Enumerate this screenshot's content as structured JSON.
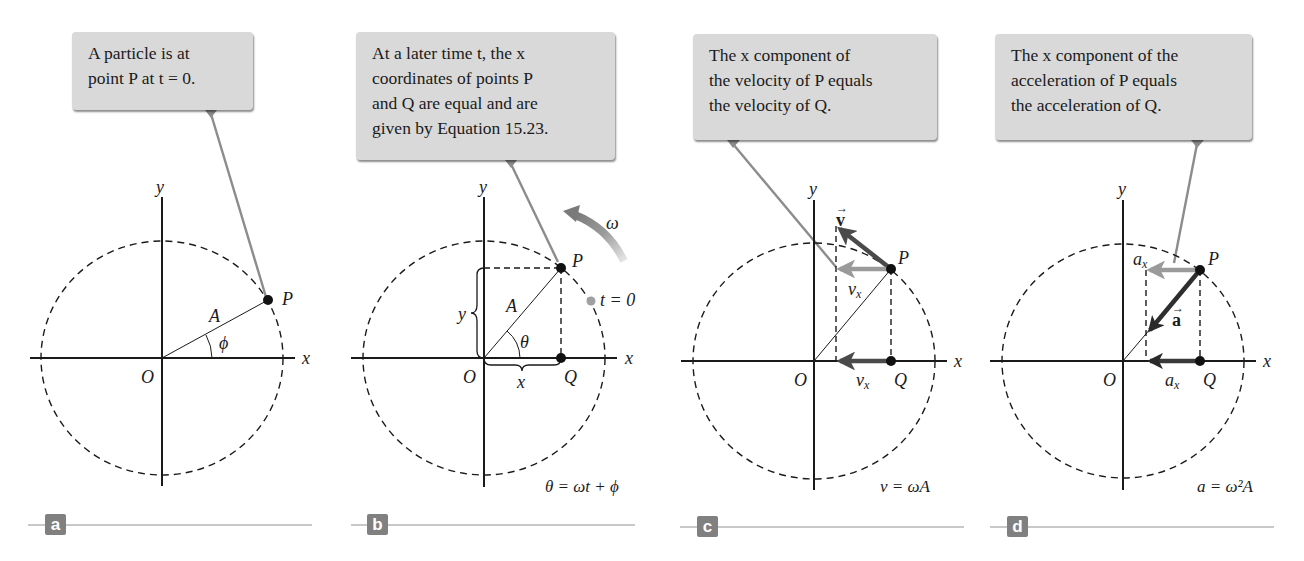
{
  "figure": {
    "panels": [
      {
        "id": "a",
        "label": "a",
        "callout": {
          "lines": [
            "A particle is at",
            "point P at t = 0."
          ]
        },
        "axis_labels": {
          "x": "x",
          "y": "y",
          "origin": "O"
        },
        "point_labels": {
          "P": "P",
          "radius": "A",
          "angle": "ϕ"
        }
      },
      {
        "id": "b",
        "label": "b",
        "callout": {
          "lines": [
            "At a later time t, the x",
            "coordinates of points P",
            "and Q are equal and are",
            "given by Equation 15.23."
          ]
        },
        "axis_labels": {
          "x": "x",
          "y": "y",
          "origin": "O"
        },
        "point_labels": {
          "P": "P",
          "Q": "Q",
          "radius": "A",
          "angle": "θ",
          "x_brace": "x",
          "y_brace": "y",
          "initial": "t = 0",
          "omega": "ω"
        },
        "equation": "θ = ωt + ϕ"
      },
      {
        "id": "c",
        "label": "c",
        "callout": {
          "lines": [
            "The x component of",
            "the velocity of P equals",
            "the velocity of Q."
          ]
        },
        "axis_labels": {
          "x": "x",
          "y": "y",
          "origin": "O"
        },
        "point_labels": {
          "P": "P",
          "Q": "Q",
          "vector": "v",
          "component_top": "vx",
          "component_bottom": "vx"
        },
        "equation": "v = ωA"
      },
      {
        "id": "d",
        "label": "d",
        "callout": {
          "lines": [
            "The x component of the",
            "acceleration of P equals",
            "the acceleration of Q."
          ]
        },
        "axis_labels": {
          "x": "x",
          "y": "y",
          "origin": "O"
        },
        "point_labels": {
          "P": "P",
          "Q": "Q",
          "vector": "a",
          "component_top": "ax",
          "component_bottom": "ax"
        },
        "equation": "a = ω²A"
      }
    ],
    "colors": {
      "callout_fill": "#d9d9d9",
      "connector": "#8c8c8c",
      "label_box": "#808080",
      "rule": "#c8c8c8",
      "vector_dark": "#505050",
      "vector_light": "#9a9a9a",
      "ink": "#1a1a1a"
    }
  }
}
